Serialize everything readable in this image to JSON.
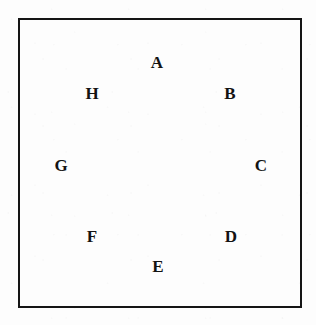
{
  "figure": {
    "background_color": "#fdfdfd",
    "ink_color": "#131313",
    "frame": {
      "name": "rectangular-border",
      "stroke_color": "#151515",
      "stroke_width_px": 2,
      "x": 18,
      "y": 18,
      "width": 284,
      "height": 290
    }
  },
  "chart_data": {
    "type": "scatter",
    "title": "",
    "xlabel": "",
    "ylabel": "",
    "grid": false,
    "legend": null,
    "xlim": [
      18,
      302
    ],
    "ylim": [
      18,
      308
    ],
    "annotations": [
      {
        "label": "A",
        "x": 157,
        "y": 62
      },
      {
        "label": "B",
        "x": 230,
        "y": 93
      },
      {
        "label": "C",
        "x": 261,
        "y": 165
      },
      {
        "label": "D",
        "x": 231,
        "y": 236
      },
      {
        "label": "E",
        "x": 158,
        "y": 266
      },
      {
        "label": "F",
        "x": 92,
        "y": 236
      },
      {
        "label": "G",
        "x": 61,
        "y": 165
      },
      {
        "label": "H",
        "x": 92,
        "y": 93
      }
    ]
  },
  "labels": [
    {
      "text": "A",
      "left": 147,
      "top": 54
    },
    {
      "text": "B",
      "left": 220,
      "top": 85
    },
    {
      "text": "C",
      "left": 251,
      "top": 157
    },
    {
      "text": "D",
      "left": 221,
      "top": 228
    },
    {
      "text": "E",
      "left": 148,
      "top": 258
    },
    {
      "text": "F",
      "left": 82,
      "top": 228
    },
    {
      "text": "G",
      "left": 51,
      "top": 157
    },
    {
      "text": "H",
      "left": 82,
      "top": 85
    }
  ]
}
